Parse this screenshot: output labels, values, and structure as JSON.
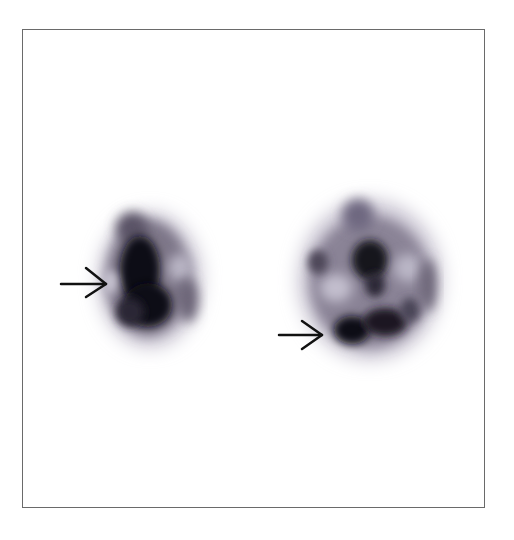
{
  "figure": {
    "type": "scintigraphy-scan",
    "panels": [
      {
        "id": "left-view",
        "arrow": {
          "direction": "right",
          "x1": 61,
          "x2": 107,
          "y": 284
        }
      },
      {
        "id": "right-view",
        "arrow": {
          "direction": "right",
          "x1": 279,
          "x2": 323,
          "y": 335
        }
      }
    ],
    "colors": {
      "background": "#ffffff",
      "frame": "#6a6a6a",
      "uptake_dark": "#0a0810",
      "uptake_mid": "#4a4458",
      "uptake_light": "#b8b4c4",
      "arrow": "#111111"
    }
  }
}
